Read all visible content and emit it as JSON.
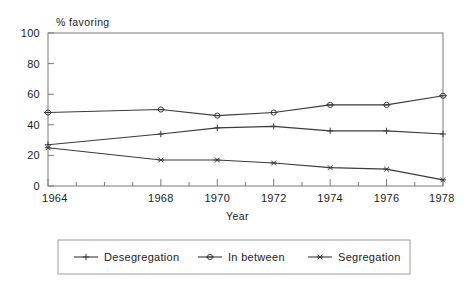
{
  "chart_data": {
    "type": "line",
    "title": "",
    "xlabel": "Year",
    "ylabel": "% favoring",
    "x": [
      1964,
      1968,
      1970,
      1972,
      1974,
      1976,
      1978
    ],
    "xlim": [
      1964,
      1978
    ],
    "ylim": [
      0,
      100
    ],
    "ytick_labels": [
      "0",
      "20",
      "40",
      "60",
      "80",
      "100"
    ],
    "ytick_values": [
      0,
      20,
      40,
      60,
      80,
      100
    ],
    "xtick_labels": [
      "1964",
      "1968",
      "1970",
      "1972",
      "1974",
      "1976",
      "1978"
    ],
    "xtick_values": [
      1964,
      1968,
      1970,
      1972,
      1974,
      1976,
      1978
    ],
    "minor_xticks": [
      1965,
      1966,
      1967,
      1969,
      1971,
      1973,
      1975,
      1977
    ],
    "grid": false,
    "legend_position": "bottom",
    "series": [
      {
        "name": "Desegregation",
        "marker": "plus",
        "color": "#3a3a3a",
        "values": [
          27,
          34,
          38,
          39,
          36,
          36,
          34
        ]
      },
      {
        "name": "In between",
        "marker": "diamond",
        "color": "#3a3a3a",
        "values": [
          48,
          50,
          46,
          48,
          53,
          53,
          59
        ]
      },
      {
        "name": "Segregation",
        "marker": "asterisk",
        "color": "#3a3a3a",
        "values": [
          25,
          17,
          17,
          15,
          12,
          11,
          4
        ]
      }
    ]
  },
  "legend": {
    "items": [
      {
        "label": "Desegregation"
      },
      {
        "label": "In between"
      },
      {
        "label": "Segregation"
      }
    ]
  },
  "colors": {
    "line": "#3a3a3a",
    "axis": "#7a7a7a",
    "text": "#1a1a1a",
    "background": "#ffffff",
    "legend_border": "#9a9a9a"
  }
}
